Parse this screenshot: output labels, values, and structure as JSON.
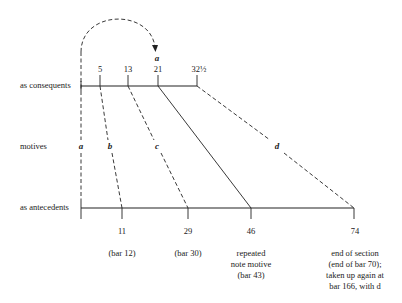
{
  "rows": {
    "consequents_label": "as consequents",
    "motives_label": "motives",
    "antecedents_label": "as antecedents"
  },
  "consequents": [
    {
      "value": "5"
    },
    {
      "value": "13"
    },
    {
      "value": "21"
    },
    {
      "value": "32½"
    }
  ],
  "antecedents": [
    {
      "value": "11",
      "note": [
        "(bar 12)"
      ]
    },
    {
      "value": "29",
      "note": [
        "(bar 30)"
      ]
    },
    {
      "value": "46",
      "note": [
        "repeated",
        "note motive",
        "(bar 43)"
      ]
    },
    {
      "value": "74",
      "note": [
        "end of section",
        "(end of bar 70);",
        "taken up again at",
        "bar 166, with d"
      ]
    }
  ],
  "motives": {
    "a": "a",
    "b": "b",
    "c": "c",
    "d": "d",
    "arc_label": "a"
  }
}
